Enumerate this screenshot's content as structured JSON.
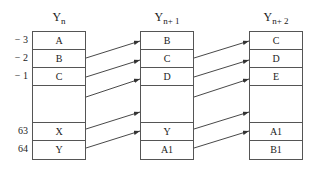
{
  "diagram": {
    "columns": [
      {
        "title_base": "Y",
        "title_sub": "n",
        "cells": [
          "A",
          "B",
          "C",
          "",
          "X",
          "Y"
        ]
      },
      {
        "title_base": "Y",
        "title_sub": "n+ 1",
        "cells": [
          "B",
          "C",
          "D",
          "",
          "Y",
          "A1"
        ]
      },
      {
        "title_base": "Y",
        "title_sub": "n+ 2",
        "cells": [
          "C",
          "D",
          "E",
          "",
          "A1",
          "B1"
        ]
      }
    ],
    "row_indices": [
      "− 3",
      "− 2",
      "− 1",
      "63",
      "64"
    ],
    "arrows": [
      {
        "from": "Y_n:B",
        "to": "Y_n+1:B"
      },
      {
        "from": "Y_n:C",
        "to": "Y_n+1:C"
      },
      {
        "from": "Y_n:gap",
        "to": "Y_n+1:D"
      },
      {
        "from": "Y_n:X",
        "to": "Y_n+1:gap"
      },
      {
        "from": "Y_n:Y",
        "to": "Y_n+1:Y"
      },
      {
        "from": "Y_n+1:C",
        "to": "Y_n+2:C"
      },
      {
        "from": "Y_n+1:D",
        "to": "Y_n+2:D"
      },
      {
        "from": "Y_n+1:gap",
        "to": "Y_n+2:E"
      },
      {
        "from": "Y_n+1:Y",
        "to": "Y_n+2:gap"
      },
      {
        "from": "Y_n+1:A1",
        "to": "Y_n+2:A1"
      }
    ]
  }
}
